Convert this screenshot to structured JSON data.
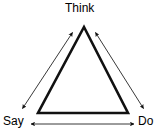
{
  "diagram": {
    "type": "triangle-cycle-diagram",
    "background_color": "#ffffff",
    "stroke_color": "#000000",
    "nodes": [
      {
        "id": "think",
        "label": "Think",
        "position": "top"
      },
      {
        "id": "say",
        "label": "Say",
        "position": "bottom-left"
      },
      {
        "id": "do",
        "label": "Do",
        "position": "bottom-right"
      }
    ],
    "edges": [
      {
        "id": "say-think",
        "from": "Say",
        "to": "Think",
        "arrow": "double",
        "side": "left"
      },
      {
        "id": "think-do",
        "from": "Think",
        "to": "Do",
        "arrow": "double",
        "side": "right"
      },
      {
        "id": "say-do",
        "from": "Say",
        "to": "Do",
        "arrow": "double",
        "side": "bottom"
      }
    ],
    "shape": {
      "name": "triangle",
      "apex": {
        "x": 84,
        "y": 27
      },
      "bottom_left": {
        "x": 38,
        "y": 113
      },
      "bottom_right": {
        "x": 128,
        "y": 113
      },
      "stroke_width": 2.6
    }
  }
}
